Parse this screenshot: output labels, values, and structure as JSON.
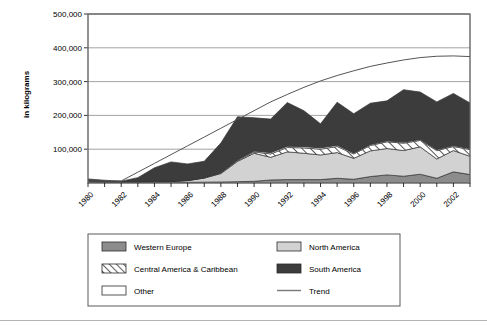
{
  "chart_data": {
    "type": "area",
    "title": "",
    "subtitle": "",
    "xlabel": "",
    "ylabel": "in kilograms",
    "stacked": true,
    "grid": true,
    "legend_position": "bottom",
    "xlim": [
      1980,
      2003
    ],
    "ylim": [
      0,
      500000
    ],
    "yticks": [
      0,
      100000,
      200000,
      300000,
      400000,
      500000
    ],
    "ytick_labels": [
      "",
      "100,000",
      "200,000",
      "300,000",
      "400,000",
      "500,000"
    ],
    "xticks": [
      1980,
      1982,
      1984,
      1986,
      1988,
      1990,
      1992,
      1994,
      1996,
      1998,
      2000,
      2002
    ],
    "xtick_labels": [
      "1980",
      "1982",
      "1984",
      "1986",
      "1988",
      "1990",
      "1992",
      "1994",
      "1996",
      "1998",
      "2000",
      "2002"
    ],
    "x": [
      1980,
      1981,
      1982,
      1983,
      1984,
      1985,
      1986,
      1987,
      1988,
      1989,
      1990,
      1991,
      1992,
      1993,
      1994,
      1995,
      1996,
      1997,
      1998,
      1999,
      2000,
      2001,
      2002,
      2003
    ],
    "series": [
      {
        "name": "Western Europe",
        "color": "#8c8c8c",
        "pattern": "solid",
        "values": [
          2000,
          1500,
          1000,
          1200,
          1500,
          1500,
          2000,
          2500,
          3000,
          4000,
          5000,
          9000,
          10000,
          10000,
          10000,
          14000,
          11000,
          19000,
          24000,
          20000,
          26000,
          14000,
          33000,
          25000
        ]
      },
      {
        "name": "North America",
        "color": "#d2d2d2",
        "pattern": "solid",
        "values": [
          3000,
          2000,
          1500,
          2000,
          2500,
          3000,
          5000,
          12000,
          25000,
          60000,
          83000,
          67000,
          82000,
          78000,
          73000,
          76000,
          62000,
          76000,
          78000,
          76000,
          81000,
          57000,
          63000,
          54000
        ]
      },
      {
        "name": "Central America & Caribbean",
        "color": "#ffffff",
        "pattern": "hatch",
        "values": [
          500,
          400,
          300,
          400,
          500,
          500,
          800,
          1000,
          2000,
          3000,
          4000,
          10000,
          13000,
          16000,
          17000,
          18000,
          13000,
          16000,
          20000,
          22000,
          19000,
          25000,
          12000,
          20000
        ]
      },
      {
        "name": "Other",
        "color": "#ffffff",
        "pattern": "solid",
        "values": [
          500,
          300,
          200,
          300,
          400,
          400,
          600,
          800,
          1500,
          2000,
          3000,
          4000,
          4000,
          4000,
          4000,
          4000,
          3000,
          3000,
          3000,
          3000,
          3000,
          3000,
          3000,
          3000
        ]
      },
      {
        "name": "South America",
        "color": "#3c3c3c",
        "pattern": "solid",
        "values": [
          6000,
          4000,
          2500,
          12000,
          40000,
          57000,
          48000,
          48000,
          87000,
          127000,
          98000,
          99000,
          129000,
          106000,
          71000,
          127000,
          116000,
          122000,
          118000,
          155000,
          140000,
          141000,
          154000,
          135000
        ]
      }
    ],
    "trend": {
      "name": "Trend",
      "color": "#555555",
      "values": [
        6000,
        6000,
        6000,
        32000,
        58000,
        84000,
        110000,
        136000,
        162000,
        188000,
        214000,
        240000,
        262000,
        283000,
        302000,
        318000,
        332000,
        345000,
        355000,
        364000,
        371000,
        375000,
        376000,
        374000
      ]
    }
  },
  "axes": {
    "ylabel": "in kilograms",
    "ytick_labels": [
      "500,000",
      "400,000",
      "300,000",
      "200,000",
      "100,000"
    ],
    "xtick_labels": [
      "1980",
      "1982",
      "1984",
      "1986",
      "1988",
      "1990",
      "1992",
      "1994",
      "1996",
      "1998",
      "2000",
      "2002"
    ]
  },
  "legend": {
    "left_column": [
      {
        "label": "Western Europe",
        "swatch": "solid-gray"
      },
      {
        "label": "Central America & Caribbean",
        "swatch": "hatch"
      },
      {
        "label": "Other",
        "swatch": "white"
      }
    ],
    "right_column": [
      {
        "label": "North America",
        "swatch": "solid-light-gray"
      },
      {
        "label": "South America",
        "swatch": "solid-dark"
      },
      {
        "label": "Trend",
        "swatch": "line"
      }
    ]
  },
  "colors": {
    "western_europe": "#8c8c8c",
    "north_america": "#d2d2d2",
    "central_america": "#ffffff",
    "other": "#ffffff",
    "south_america": "#3c3c3c",
    "trend": "#555555",
    "frame": "#6e6e6e",
    "grid": "#8c8c8c"
  }
}
